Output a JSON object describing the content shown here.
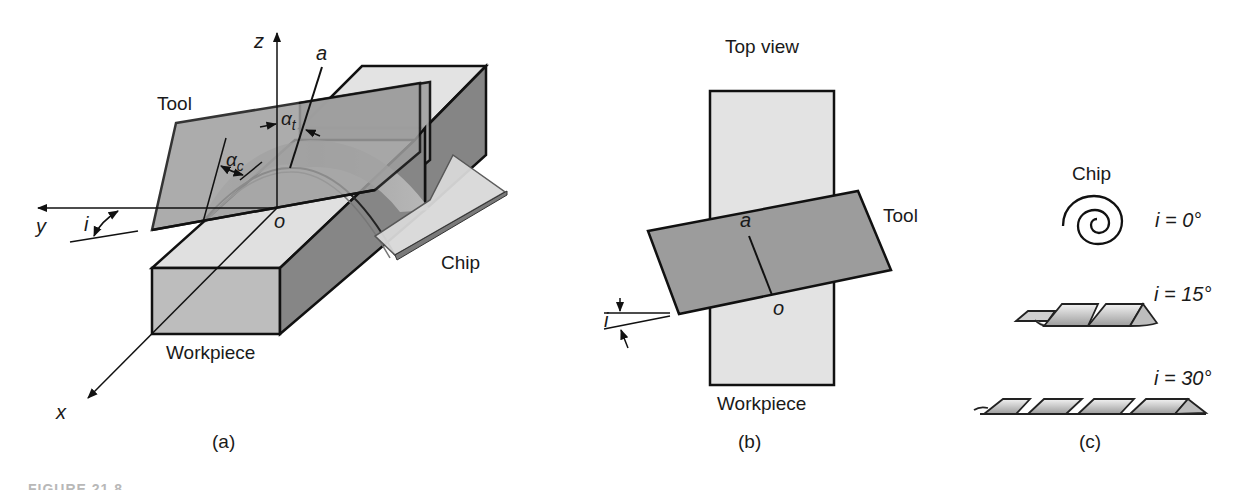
{
  "figure": {
    "panels": [
      {
        "id": "a",
        "label": "(a)",
        "title": "Oblique cutting, 3-D view",
        "axes": {
          "x": "x",
          "y": "y",
          "z": "z"
        },
        "points": {
          "origin": "o",
          "a": "a"
        },
        "angles": {
          "alpha_c": "α",
          "alpha_c_sub": "c",
          "alpha_t": "α",
          "alpha_t_sub": "t",
          "inclination": "i"
        },
        "parts": {
          "tool": "Tool",
          "chip": "Chip",
          "workpiece": "Workpiece"
        }
      },
      {
        "id": "b",
        "label": "(b)",
        "title": "Top view",
        "points": {
          "a": "a",
          "origin": "o"
        },
        "angles": {
          "inclination": "i"
        },
        "parts": {
          "tool": "Tool",
          "workpiece": "Workpiece"
        }
      },
      {
        "id": "c",
        "label": "(c)",
        "title": "Chip",
        "chips": [
          {
            "label": "i = 0°",
            "shape": "spiral"
          },
          {
            "label": "i = 15°",
            "shape": "helix-short"
          },
          {
            "label": "i = 30°",
            "shape": "helix-long"
          }
        ]
      }
    ],
    "caption_partial": "FIGURE 21.8"
  },
  "colors": {
    "line": "#111111",
    "tool_fill": "#9a9a9a",
    "work_top": "#e0e0e0",
    "work_front": "#bdbdbd",
    "work_side": "#858585",
    "chip_fill": "#d6d6d6",
    "background": "#ffffff"
  }
}
